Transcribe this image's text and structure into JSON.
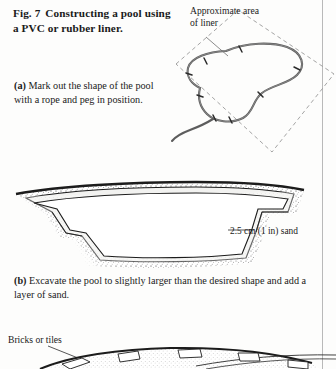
{
  "figure": {
    "title_number": "Fig. 7",
    "title_line1": "Constructing a pool",
    "title_line2": "using a PVC or rubber liner."
  },
  "panels": [
    {
      "id": "panel-a",
      "caption_marker": "(a)",
      "caption_text": " Mark out the shape of the pool with a rope and peg in position.",
      "annotations": [
        {
          "name": "approximate-area-of-liner",
          "text": "Approximate area of liner"
        }
      ],
      "illustration": "plan view of kidney-shaped rope outline with pegs inside a dashed rectangle marking the liner area"
    },
    {
      "id": "panel-b",
      "caption_marker": "(b)",
      "caption_text": " Excavate the pool to slightly larger than the desired shape and add a layer of sand.",
      "annotations": [
        {
          "name": "sand-layer",
          "text": "2.5 cm (1 in) sand"
        }
      ],
      "illustration": "cross-section of stepped excavation with marginal shelf and stippled soil, lined with sand"
    },
    {
      "id": "panel-c",
      "caption_marker": "",
      "caption_text": "",
      "annotations": [
        {
          "name": "bricks-or-tiles",
          "text": "Bricks or tiles"
        }
      ],
      "illustration": "partial cross-section of pool edge with brick or tile edging, cropped at page bottom"
    }
  ],
  "colors": {
    "ink": "#1a1a1a",
    "paper": "#fdfdfc",
    "rule": "#b9b9b9",
    "dashed_guide": "#8d8d8d",
    "rope": "#5d5d5d",
    "soil_stipple": "#2a2a2a",
    "sand_fill": "#ececea"
  }
}
